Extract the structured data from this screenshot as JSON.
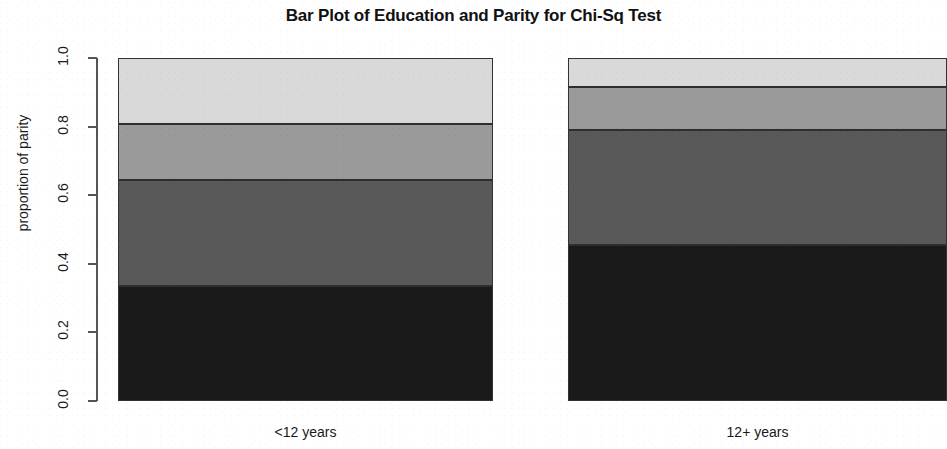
{
  "chart_data": {
    "type": "bar",
    "subtype": "stacked-proportional",
    "title": "Bar Plot of Education and Parity for Chi-Sq Test",
    "xlabel": "",
    "ylabel": "proportion of parity",
    "ylim": [
      0.0,
      1.0
    ],
    "ytick_labels": [
      "0.0",
      "0.2",
      "0.4",
      "0.6",
      "0.8",
      "1.0"
    ],
    "ytick_values": [
      0.0,
      0.2,
      0.4,
      0.6,
      0.8,
      1.0
    ],
    "grid": false,
    "legend": "none",
    "categories": [
      "<12 years",
      "12+ years"
    ],
    "series": [
      {
        "name": "parity 1",
        "color": "#1a1a1a",
        "values": [
          0.336,
          0.456
        ]
      },
      {
        "name": "parity 2",
        "color": "#595959",
        "values": [
          0.307,
          0.333
        ]
      },
      {
        "name": "parity 3",
        "color": "#9a9a9a",
        "values": [
          0.164,
          0.126
        ]
      },
      {
        "name": "parity 4",
        "color": "#d9d9d9",
        "values": [
          0.193,
          0.085
        ]
      }
    ],
    "cumulative_boundaries": {
      "<12 years": [
        0.336,
        0.643,
        0.807,
        1.0
      ],
      "12+ years": [
        0.456,
        0.789,
        0.915,
        1.0
      ]
    }
  },
  "axis": {
    "y_title": "proportion of parity",
    "ticks": [
      "1.0",
      "0.8",
      "0.6",
      "0.4",
      "0.2",
      "0.0"
    ]
  },
  "bars": [
    {
      "label": "<12 years"
    },
    {
      "label": "12+ years"
    }
  ]
}
